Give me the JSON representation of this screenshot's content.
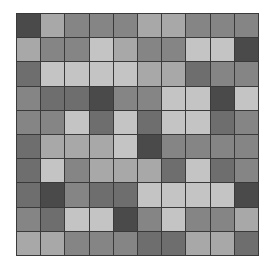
{
  "grid": {
    "rows": 10,
    "cols": 10,
    "palette": {
      "d": "#4a4a4a",
      "md": "#6e6e6e",
      "m": "#858585",
      "l": "#a8a8a8",
      "ll": "#c4c4c4"
    },
    "cells": [
      [
        "d",
        "l",
        "m",
        "m",
        "m",
        "l",
        "l",
        "m",
        "m",
        "m"
      ],
      [
        "l",
        "m",
        "m",
        "ll",
        "l",
        "m",
        "m",
        "ll",
        "ll",
        "d"
      ],
      [
        "md",
        "ll",
        "ll",
        "ll",
        "ll",
        "l",
        "l",
        "md",
        "m",
        "m"
      ],
      [
        "m",
        "md",
        "md",
        "d",
        "m",
        "m",
        "ll",
        "ll",
        "d",
        "ll"
      ],
      [
        "m",
        "m",
        "ll",
        "md",
        "ll",
        "md",
        "ll",
        "ll",
        "md",
        "m"
      ],
      [
        "md",
        "l",
        "l",
        "l",
        "ll",
        "d",
        "m",
        "m",
        "m",
        "m"
      ],
      [
        "md",
        "ll",
        "m",
        "l",
        "l",
        "l",
        "md",
        "ll",
        "md",
        "m"
      ],
      [
        "md",
        "d",
        "m",
        "md",
        "md",
        "ll",
        "ll",
        "ll",
        "ll",
        "d"
      ],
      [
        "m",
        "md",
        "ll",
        "ll",
        "d",
        "m",
        "ll",
        "m",
        "m",
        "l"
      ],
      [
        "l",
        "l",
        "m",
        "m",
        "m",
        "md",
        "md",
        "l",
        "l",
        "md"
      ]
    ]
  }
}
